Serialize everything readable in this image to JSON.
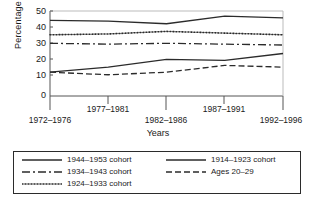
{
  "chart_data": {
    "type": "line",
    "title": "",
    "xlabel": "Years",
    "ylabel": "Percentage",
    "categories": [
      "1972–1976",
      "1977–1981",
      "1982–1986",
      "1987–1991",
      "1992–1996"
    ],
    "ylim": [
      0,
      50
    ],
    "yticks": [
      0,
      10,
      20,
      30,
      40,
      50
    ],
    "ytick_labels": [
      "0",
      "10",
      "20",
      "30",
      "40",
      "50"
    ],
    "grid": false,
    "legend_position": "below-plot",
    "series": [
      {
        "name": "1944–1953 cohort",
        "style": "solid",
        "values": [
          44.5,
          44.0,
          42.5,
          47.0,
          46.0
        ]
      },
      {
        "name": "1934–1943 cohort",
        "style": "dash-dot",
        "values": [
          31.0,
          30.5,
          31.0,
          30.5,
          30.0
        ]
      },
      {
        "name": "1924–1933 cohort",
        "style": "dotted",
        "values": [
          36.0,
          36.5,
          38.0,
          37.0,
          36.0
        ]
      },
      {
        "name": "1914–1923 cohort",
        "style": "solid",
        "values": [
          14.0,
          17.0,
          21.5,
          21.0,
          25.0
        ]
      },
      {
        "name": "Ages 20–29",
        "style": "dashed",
        "values": [
          14.0,
          12.5,
          14.0,
          18.0,
          17.0
        ]
      }
    ]
  },
  "axis": {
    "ylabel": "Percentage",
    "xlabel": "Years",
    "ytick_labels": [
      "50",
      "40",
      "30",
      "20",
      "10",
      "0"
    ],
    "xtick_labels": [
      "1972–1976",
      "1977–1981",
      "1982–1986",
      "1987–1991",
      "1992–1996"
    ]
  },
  "legend": {
    "entries": [
      {
        "label": "1944–1953 cohort",
        "style": "solid"
      },
      {
        "label": "1934–1943 cohort",
        "style": "dash-dot"
      },
      {
        "label": "1924–1933 cohort",
        "style": "dotted"
      },
      {
        "label": "1914–1923 cohort",
        "style": "solid"
      },
      {
        "label": "Ages 20–29",
        "style": "dashed"
      }
    ]
  },
  "colors": {
    "line": "#2b2b2b",
    "axis": "#555555",
    "background": "#ffffff"
  }
}
